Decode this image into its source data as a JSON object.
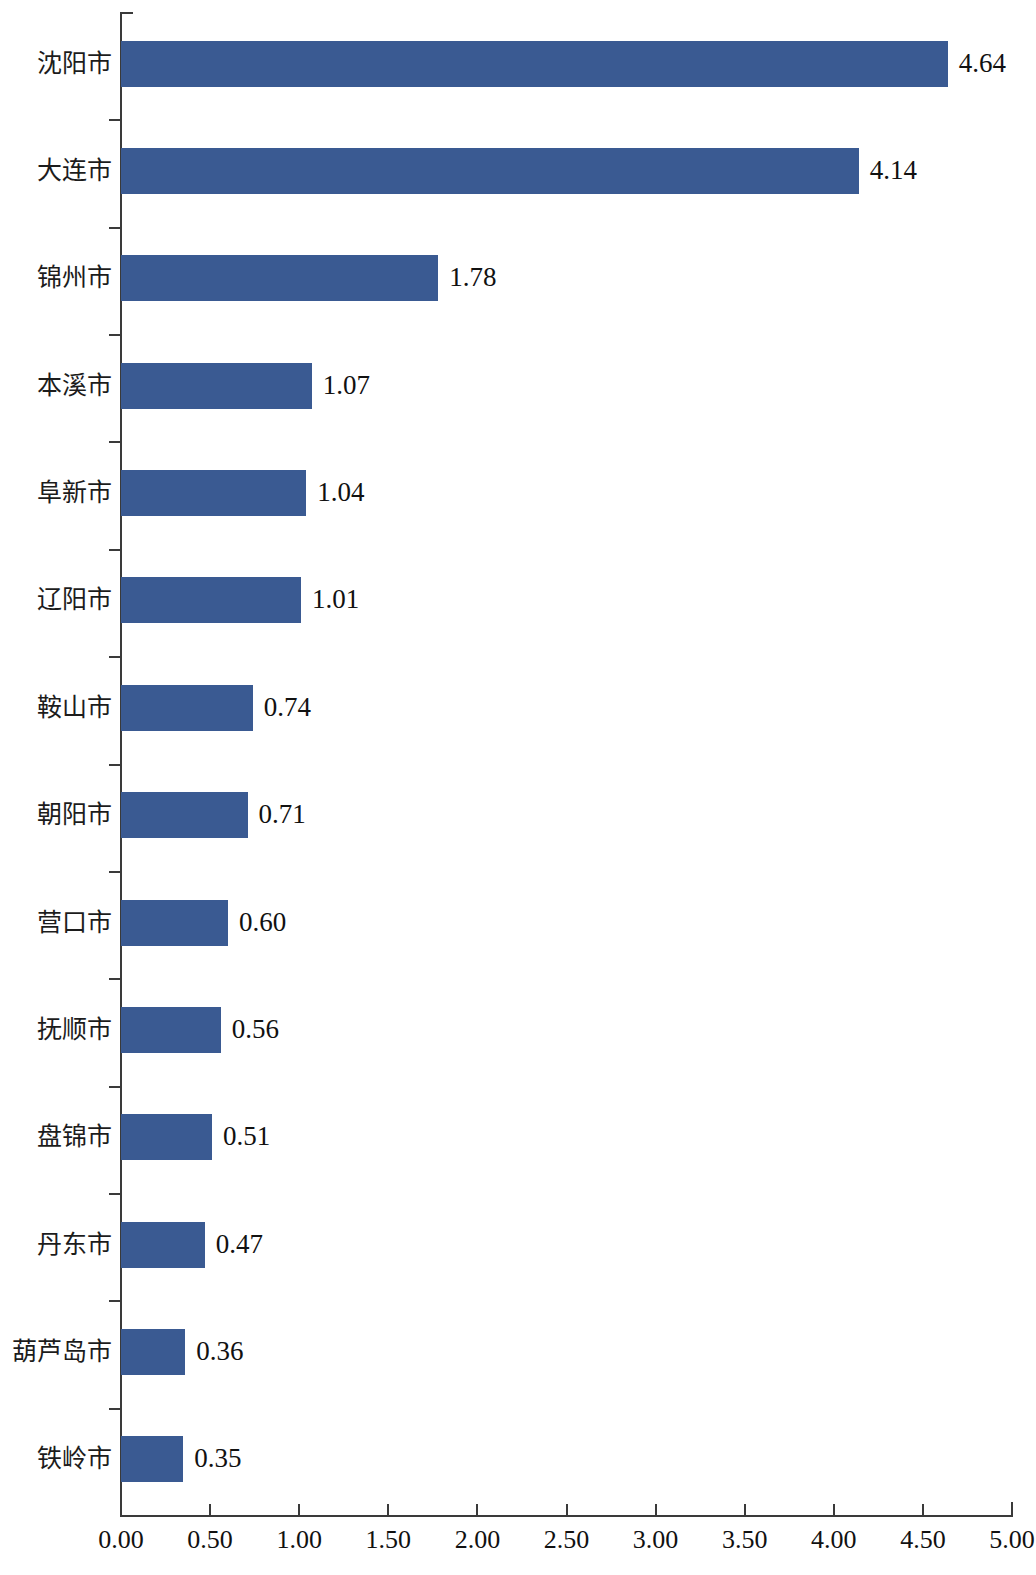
{
  "chart_data": {
    "type": "bar",
    "orientation": "horizontal",
    "title": "",
    "subtitle": "",
    "xlabel": "",
    "ylabel": "",
    "xlim": [
      0.0,
      5.0
    ],
    "xticks": [
      "0.00",
      "0.50",
      "1.00",
      "1.50",
      "2.00",
      "2.50",
      "3.00",
      "3.50",
      "4.00",
      "4.50",
      "5.00"
    ],
    "xtick_values": [
      0.0,
      0.5,
      1.0,
      1.5,
      2.0,
      2.5,
      3.0,
      3.5,
      4.0,
      4.5,
      5.0
    ],
    "grid": false,
    "legend": null,
    "bar_color": "#3a5a92",
    "axis_color": "#3a3a3a",
    "text_color": "#111111",
    "categories": [
      "沈阳市",
      "大连市",
      "锦州市",
      "本溪市",
      "阜新市",
      "辽阳市",
      "鞍山市",
      "朝阳市",
      "营口市",
      "抚顺市",
      "盘锦市",
      "丹东市",
      "葫芦岛市",
      "铁岭市"
    ],
    "values": [
      4.64,
      4.14,
      1.78,
      1.07,
      1.04,
      1.01,
      0.74,
      0.71,
      0.6,
      0.56,
      0.51,
      0.47,
      0.36,
      0.35
    ],
    "value_labels": [
      "4.64",
      "4.14",
      "1.78",
      "1.07",
      "1.04",
      "1.01",
      "0.74",
      "0.71",
      "0.60",
      "0.56",
      "0.51",
      "0.47",
      "0.36",
      "0.35"
    ],
    "bars": [
      {
        "category": "沈阳市",
        "value": 4.64,
        "label": "4.64"
      },
      {
        "category": "大连市",
        "value": 4.14,
        "label": "4.14"
      },
      {
        "category": "锦州市",
        "value": 1.78,
        "label": "1.78"
      },
      {
        "category": "本溪市",
        "value": 1.07,
        "label": "1.07"
      },
      {
        "category": "阜新市",
        "value": 1.04,
        "label": "1.04"
      },
      {
        "category": "辽阳市",
        "value": 1.01,
        "label": "1.01"
      },
      {
        "category": "鞍山市",
        "value": 0.74,
        "label": "0.74"
      },
      {
        "category": "朝阳市",
        "value": 0.71,
        "label": "0.71"
      },
      {
        "category": "营口市",
        "value": 0.6,
        "label": "0.60"
      },
      {
        "category": "抚顺市",
        "value": 0.56,
        "label": "0.56"
      },
      {
        "category": "盘锦市",
        "value": 0.51,
        "label": "0.51"
      },
      {
        "category": "丹东市",
        "value": 0.47,
        "label": "0.47"
      },
      {
        "category": "葫芦岛市",
        "value": 0.36,
        "label": "0.36"
      },
      {
        "category": "铁岭市",
        "value": 0.35,
        "label": "0.35"
      }
    ]
  }
}
